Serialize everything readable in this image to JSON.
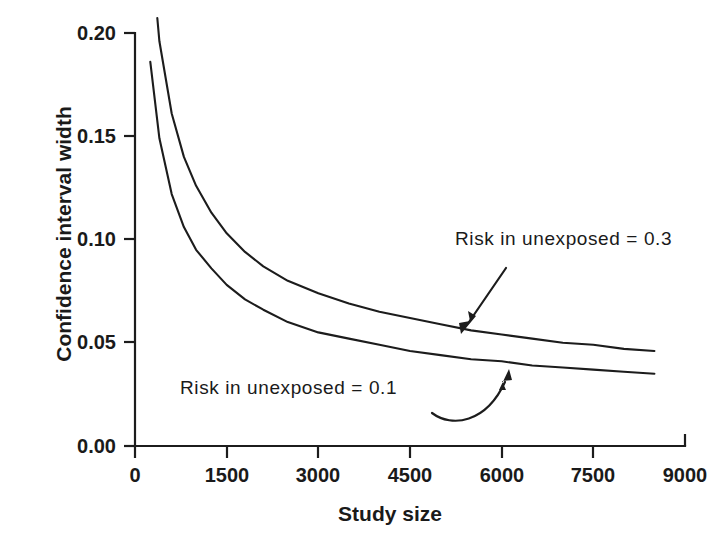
{
  "chart_data": {
    "type": "line",
    "title": "",
    "xlabel": "Study size",
    "ylabel": "Confidence interval width",
    "xlim": [
      0,
      9000
    ],
    "ylim": [
      0.0,
      0.2
    ],
    "grid": false,
    "legend_position": "inline-annotations",
    "xticks": [
      "0",
      "1500",
      "3000",
      "4500",
      "6000",
      "7500",
      "9000"
    ],
    "xtick_values": [
      0,
      1500,
      3000,
      4500,
      6000,
      7500,
      9000
    ],
    "yticks": [
      "0.00",
      "0.05",
      "0.10",
      "0.15",
      "0.20"
    ],
    "ytick_values": [
      0.0,
      0.05,
      0.1,
      0.15,
      0.2
    ],
    "series": [
      {
        "name": "Risk in unexposed = 0.3",
        "x": [
          250,
          400,
          600,
          800,
          1000,
          1250,
          1500,
          1800,
          2100,
          2500,
          3000,
          3500,
          4000,
          4500,
          5000,
          5500,
          6000,
          6500,
          7000,
          7500,
          8000,
          8500
        ],
        "values": [
          0.245,
          0.196,
          0.161,
          0.14,
          0.126,
          0.113,
          0.103,
          0.094,
          0.087,
          0.08,
          0.074,
          0.069,
          0.065,
          0.062,
          0.059,
          0.056,
          0.054,
          0.052,
          0.05,
          0.049,
          0.047,
          0.046
        ]
      },
      {
        "name": "Risk in unexposed = 0.1",
        "x": [
          250,
          400,
          600,
          800,
          1000,
          1250,
          1500,
          1800,
          2100,
          2500,
          3000,
          3500,
          4000,
          4500,
          5000,
          5500,
          6000,
          6500,
          7000,
          7500,
          8000,
          8500
        ],
        "values": [
          0.186,
          0.149,
          0.122,
          0.106,
          0.095,
          0.086,
          0.078,
          0.071,
          0.066,
          0.06,
          0.055,
          0.052,
          0.049,
          0.046,
          0.044,
          0.042,
          0.041,
          0.039,
          0.038,
          0.037,
          0.036,
          0.035
        ]
      }
    ],
    "annotations": [
      {
        "text": "Risk in unexposed = 0.3",
        "points_to": "upper-curve",
        "arrow_style": "straight"
      },
      {
        "text": "Risk in unexposed = 0.1",
        "points_to": "lower-curve",
        "arrow_style": "curved"
      }
    ]
  },
  "axes": {
    "y_title": "Confidence interval width",
    "x_title": "Study size",
    "y_tick_labels": [
      "0.20",
      "0.15",
      "0.10",
      "0.05",
      "0.00"
    ],
    "x_tick_labels": [
      "0",
      "1500",
      "3000",
      "4500",
      "6000",
      "7500",
      "9000"
    ]
  },
  "annotations": {
    "high": "Risk in unexposed = 0.3",
    "low": "Risk in unexposed = 0.1"
  },
  "colors": {
    "ink": "#1c1c1c",
    "background": "#ffffff"
  }
}
